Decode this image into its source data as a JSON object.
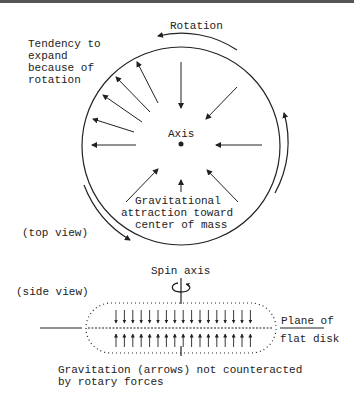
{
  "top_view": {
    "rotation_label": "Rotation",
    "expand_label": [
      "Tendency to",
      "expand",
      "because of",
      "rotation"
    ],
    "axis_label": "Axis",
    "gravity_label": [
      "Gravitational",
      "attraction toward",
      "center of mass"
    ],
    "view_label": "(top view)"
  },
  "side_view": {
    "spin_axis_label": "Spin axis",
    "view_label": "(side view)",
    "plane_label": [
      "Plane of",
      "flat disk"
    ],
    "caption": [
      "Gravitation (arrows) not counteracted",
      "by rotary forces"
    ]
  },
  "colors": {
    "ink": "#222222",
    "background": "#ffffff",
    "top_bar": "#555555"
  }
}
